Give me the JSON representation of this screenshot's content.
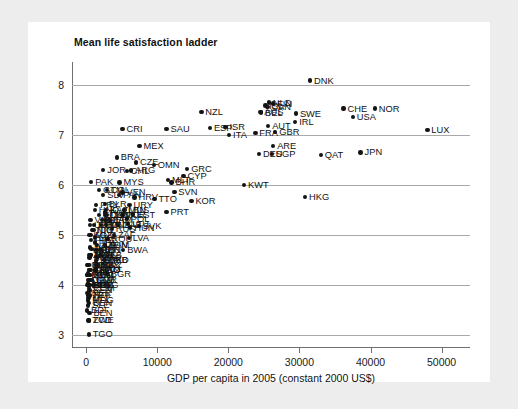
{
  "chart_data": {
    "type": "scatter",
    "title": "Mean life satisfaction ladder",
    "xlabel": "GDP per capita in 2005 (constant 2000 US$)",
    "ylabel": "",
    "xlim": [
      -2000,
      54000
    ],
    "ylim": [
      2.75,
      8.45
    ],
    "xticks": [
      "0",
      "10000",
      "20000",
      "30000",
      "40000",
      "50000"
    ],
    "xtick_values": [
      0,
      10000,
      20000,
      30000,
      40000,
      50000
    ],
    "yticks": [
      "3",
      "4",
      "5",
      "6",
      "7",
      "8"
    ],
    "ytick_values": [
      3,
      4,
      5,
      6,
      7,
      8
    ],
    "grid": "horizontal",
    "legend": "none",
    "marker_color": "#141414",
    "points": [
      {
        "label": "DNK",
        "x": 31500,
        "y": 8.08
      },
      {
        "label": "NOR",
        "x": 40600,
        "y": 7.52
      },
      {
        "label": "CHE",
        "x": 36200,
        "y": 7.52
      },
      {
        "label": "USA",
        "x": 37500,
        "y": 7.35
      },
      {
        "label": "SWE",
        "x": 29500,
        "y": 7.42
      },
      {
        "label": "IRL",
        "x": 29400,
        "y": 7.25
      },
      {
        "label": "FIN",
        "x": 26300,
        "y": 7.62
      },
      {
        "label": "NLD",
        "x": 25700,
        "y": 7.64
      },
      {
        "label": "ISL",
        "x": 25200,
        "y": 7.58
      },
      {
        "label": "BEL",
        "x": 24600,
        "y": 7.44
      },
      {
        "label": "AUT",
        "x": 25600,
        "y": 7.18
      },
      {
        "label": "GBR",
        "x": 26600,
        "y": 7.05
      },
      {
        "label": "FRA",
        "x": 23800,
        "y": 7.04
      },
      {
        "label": "ARE",
        "x": 26300,
        "y": 6.78
      },
      {
        "label": "DEU",
        "x": 24300,
        "y": 6.62
      },
      {
        "label": "SGP",
        "x": 26100,
        "y": 6.62
      },
      {
        "label": "JPN",
        "x": 38600,
        "y": 6.65
      },
      {
        "label": "HKG",
        "x": 30800,
        "y": 5.76
      },
      {
        "label": "NZL",
        "x": 16200,
        "y": 7.45
      },
      {
        "label": "ISR",
        "x": 19600,
        "y": 7.15
      },
      {
        "label": "ESP",
        "x": 17400,
        "y": 7.14
      },
      {
        "label": "ITA",
        "x": 20100,
        "y": 6.99
      },
      {
        "label": "SAU",
        "x": 11300,
        "y": 7.12
      },
      {
        "label": "CRI",
        "x": 5100,
        "y": 7.12
      },
      {
        "label": "MEX",
        "x": 7500,
        "y": 6.77
      },
      {
        "label": "BRA",
        "x": 4300,
        "y": 6.55
      },
      {
        "label": "CZE",
        "x": 7000,
        "y": 6.45
      },
      {
        "label": "GRC",
        "x": 14200,
        "y": 6.32
      },
      {
        "label": "CYP",
        "x": 13700,
        "y": 6.18
      },
      {
        "label": "ARG",
        "x": 6300,
        "y": 6.29
      },
      {
        "label": "JOR",
        "x": 2400,
        "y": 6.3
      },
      {
        "label": "CHL",
        "x": 5700,
        "y": 6.28
      },
      {
        "label": "PAK",
        "x": 700,
        "y": 6.06
      },
      {
        "label": "MYS",
        "x": 4700,
        "y": 6.05
      },
      {
        "label": "KWT",
        "x": 22200,
        "y": 6.0
      },
      {
        "label": "SVN",
        "x": 12400,
        "y": 5.86
      },
      {
        "label": "TTO",
        "x": 9600,
        "y": 5.72
      },
      {
        "label": "KOR",
        "x": 14800,
        "y": 5.68
      },
      {
        "label": "PRT",
        "x": 11300,
        "y": 5.46
      },
      {
        "label": "HRV",
        "x": 6800,
        "y": 5.75
      },
      {
        "label": "BLR",
        "x": 2600,
        "y": 5.62
      },
      {
        "label": "URY",
        "x": 6100,
        "y": 5.6
      },
      {
        "label": "KAZ",
        "x": 2800,
        "y": 5.5
      },
      {
        "label": "LBN",
        "x": 5300,
        "y": 5.5
      },
      {
        "label": "EST",
        "x": 6600,
        "y": 5.41
      },
      {
        "label": "SVK",
        "x": 7400,
        "y": 5.18
      },
      {
        "label": "LVA",
        "x": 6000,
        "y": 4.94
      },
      {
        "label": "HUN",
        "x": 6200,
        "y": 5.15
      },
      {
        "label": "POL",
        "x": 5700,
        "y": 5.33
      },
      {
        "label": "LTU",
        "x": 5900,
        "y": 5.22
      },
      {
        "label": "BGR",
        "x": 2900,
        "y": 4.22
      },
      {
        "label": "ROU",
        "x": 3000,
        "y": 4.92
      },
      {
        "label": "RUS",
        "x": 3600,
        "y": 5.12
      },
      {
        "label": "UKR",
        "x": 1400,
        "y": 4.48
      },
      {
        "label": "SRB",
        "x": 2600,
        "y": 4.5
      },
      {
        "label": "GEO",
        "x": 1300,
        "y": 4.3
      },
      {
        "label": "ARM",
        "x": 1400,
        "y": 4.32
      },
      {
        "label": "ZWE",
        "x": 400,
        "y": 3.3
      },
      {
        "label": "TCD",
        "x": 300,
        "y": 3.3
      },
      {
        "label": "TGO",
        "x": 350,
        "y": 3.02
      },
      {
        "label": "BEN",
        "x": 450,
        "y": 3.45
      },
      {
        "label": "BDI",
        "x": 120,
        "y": 3.5
      },
      {
        "label": "ETH",
        "x": 150,
        "y": 4.0
      },
      {
        "label": "NPL",
        "x": 280,
        "y": 4.05
      },
      {
        "label": "IND",
        "x": 750,
        "y": 4.72
      },
      {
        "label": "CHN",
        "x": 1500,
        "y": 4.7
      },
      {
        "label": "IDN",
        "x": 1000,
        "y": 5.1
      },
      {
        "label": "PHL",
        "x": 1200,
        "y": 4.85
      },
      {
        "label": "VNM",
        "x": 600,
        "y": 5.3
      },
      {
        "label": "THA",
        "x": 2600,
        "y": 5.45
      },
      {
        "label": "TUR",
        "x": 5100,
        "y": 5.4
      },
      {
        "label": "ZAF",
        "x": 3900,
        "y": 5.0
      },
      {
        "label": "EGY",
        "x": 1400,
        "y": 4.4
      },
      {
        "label": "MAR",
        "x": 1500,
        "y": 4.55
      },
      {
        "label": "NGA",
        "x": 550,
        "y": 4.75
      },
      {
        "label": "KEN",
        "x": 450,
        "y": 3.9
      },
      {
        "label": "GHA",
        "x": 350,
        "y": 4.3
      },
      {
        "label": "TZA",
        "x": 330,
        "y": 3.8
      },
      {
        "label": "UGA",
        "x": 300,
        "y": 4.1
      },
      {
        "label": "MLI",
        "x": 300,
        "y": 3.75
      },
      {
        "label": "NER",
        "x": 200,
        "y": 3.85
      },
      {
        "label": "SEN",
        "x": 520,
        "y": 4.2
      },
      {
        "label": "CMR",
        "x": 800,
        "y": 4.1
      },
      {
        "label": "ZMB",
        "x": 400,
        "y": 4.6
      },
      {
        "label": "MOZ",
        "x": 310,
        "y": 4.0
      },
      {
        "label": "RWA",
        "x": 280,
        "y": 4.4
      },
      {
        "label": "MDG",
        "x": 270,
        "y": 3.7
      },
      {
        "label": "BFA",
        "x": 320,
        "y": 4.0
      },
      {
        "label": "MWI",
        "x": 180,
        "y": 4.2
      },
      {
        "label": "COD",
        "x": 110,
        "y": 4.4
      },
      {
        "label": "AGO",
        "x": 1300,
        "y": 4.3
      },
      {
        "label": "SDN",
        "x": 600,
        "y": 4.6
      },
      {
        "label": "YEM",
        "x": 600,
        "y": 4.1
      },
      {
        "label": "IRQ",
        "x": 1200,
        "y": 4.7
      },
      {
        "label": "IRN",
        "x": 2100,
        "y": 5.2
      },
      {
        "label": "DZA",
        "x": 2200,
        "y": 5.3
      },
      {
        "label": "TUN",
        "x": 2600,
        "y": 4.8
      },
      {
        "label": "COL",
        "x": 2900,
        "y": 5.9
      },
      {
        "label": "VEN",
        "x": 5100,
        "y": 5.85
      },
      {
        "label": "PER",
        "x": 2700,
        "y": 5.3
      },
      {
        "label": "ECU",
        "x": 1800,
        "y": 5.4
      },
      {
        "label": "BOL",
        "x": 1100,
        "y": 5.2
      },
      {
        "label": "PRY",
        "x": 1400,
        "y": 5.6
      },
      {
        "label": "GTM",
        "x": 1800,
        "y": 5.9
      },
      {
        "label": "HND",
        "x": 1200,
        "y": 5.5
      },
      {
        "label": "NIC",
        "x": 900,
        "y": 5.1
      },
      {
        "label": "SLV",
        "x": 2400,
        "y": 5.8
      },
      {
        "label": "DOM",
        "x": 2900,
        "y": 5.4
      },
      {
        "label": "JAM",
        "x": 3300,
        "y": 5.3
      },
      {
        "label": "CUB",
        "x": 2700,
        "y": 5.4
      },
      {
        "label": "PAN",
        "x": 4600,
        "y": 5.8
      },
      {
        "label": "LKA",
        "x": 1200,
        "y": 4.95
      },
      {
        "label": "BGD",
        "x": 450,
        "y": 4.55
      },
      {
        "label": "KHM",
        "x": 450,
        "y": 4.2
      },
      {
        "label": "UZB",
        "x": 550,
        "y": 5.2
      },
      {
        "label": "KGZ",
        "x": 450,
        "y": 5.0
      },
      {
        "label": "TJK",
        "x": 330,
        "y": 4.4
      },
      {
        "label": "AZE",
        "x": 1500,
        "y": 4.8
      },
      {
        "label": "MDA",
        "x": 700,
        "y": 4.6
      },
      {
        "label": "MKD",
        "x": 2500,
        "y": 4.5
      },
      {
        "label": "ALB",
        "x": 2000,
        "y": 4.6
      },
      {
        "label": "BIH",
        "x": 2000,
        "y": 4.7
      },
      {
        "label": "MNE",
        "x": 2800,
        "y": 5.2
      },
      {
        "label": "MUS",
        "x": 5400,
        "y": 5.5
      },
      {
        "label": "BWA",
        "x": 5200,
        "y": 4.7
      },
      {
        "label": "NAM",
        "x": 2600,
        "y": 4.8
      },
      {
        "label": "SEN2",
        "x": 500,
        "y": 4.0
      },
      {
        "label": "CIV",
        "x": 700,
        "y": 4.3
      },
      {
        "label": "GIN",
        "x": 400,
        "y": 4.0
      },
      {
        "label": "SLE",
        "x": 250,
        "y": 3.6
      },
      {
        "label": "LBR",
        "x": 180,
        "y": 4.2
      },
      {
        "label": "HTI",
        "x": 450,
        "y": 3.8
      },
      {
        "label": "MRT",
        "x": 550,
        "y": 4.6
      },
      {
        "label": "COM",
        "x": 400,
        "y": 3.95
      },
      {
        "label": "BEN2",
        "x": 400,
        "y": 3.65
      },
      {
        "label": "NPL2",
        "x": 260,
        "y": 4.25
      },
      {
        "label": "PNG",
        "x": 650,
        "y": 4.9
      },
      {
        "label": "MNG",
        "x": 700,
        "y": 5.0
      },
      {
        "label": "GMB",
        "x": 400,
        "y": 4.4
      },
      {
        "label": "SWZ",
        "x": 1600,
        "y": 4.4
      },
      {
        "label": "LSO",
        "x": 450,
        "y": 4.3
      },
      {
        "label": "COG",
        "x": 1000,
        "y": 4.0
      },
      {
        "label": "GAB",
        "x": 4500,
        "y": 5.2
      },
      {
        "label": "BHR",
        "x": 12000,
        "y": 6.05
      },
      {
        "label": "OMN",
        "x": 9500,
        "y": 6.4
      },
      {
        "label": "QAT",
        "x": 33000,
        "y": 6.6
      },
      {
        "label": "MLT",
        "x": 11500,
        "y": 6.1
      },
      {
        "label": "CAN",
        "x": 25500,
        "y": 7.55
      },
      {
        "label": "AUS",
        "x": 24500,
        "y": 7.45
      },
      {
        "label": "LUX",
        "x": 48000,
        "y": 7.1
      }
    ]
  }
}
